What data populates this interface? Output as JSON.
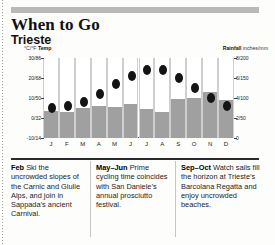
{
  "page": {
    "title": "When to Go",
    "subtitle": "Trieste"
  },
  "chart_labels": {
    "left_axis_strong": "Temp",
    "left_axis_unit": "°C/°F ",
    "right_axis_strong": "Rainfall",
    "right_axis_unit": " inches/mm"
  },
  "tips": [
    {
      "period": "Feb",
      "text": " Ski the uncrowded slopes of the Carnic and Giulie Alps, and join in Sappada’s ancient Carnival."
    },
    {
      "period": "May–Jun",
      "text": " Prime cycling time coincides with San Daniele’s annual prosciutto festival."
    },
    {
      "period": "Sep–Oct",
      "text": " Watch sails fill the horizon at Trieste’s Barcolana Regatta and enjoy uncrowded beaches."
    }
  ],
  "chart_data": {
    "type": "bar",
    "categories": [
      "J",
      "F",
      "M",
      "A",
      "M",
      "J",
      "J",
      "A",
      "S",
      "O",
      "N",
      "D"
    ],
    "series": [
      {
        "name": "Rainfall",
        "type": "bar",
        "unit": "inches",
        "axis": "right",
        "values": [
          2.7,
          2.6,
          3.0,
          3.2,
          3.1,
          3.4,
          2.9,
          2.6,
          3.9,
          4.0,
          4.6,
          3.8
        ]
      },
      {
        "name": "Temp",
        "type": "scatter",
        "unit": "°C",
        "axis": "left",
        "values": [
          5,
          6,
          8,
          12,
          17,
          21,
          24,
          24,
          20,
          15,
          10,
          6
        ]
      }
    ],
    "left_axis": {
      "label": "°C/°F Temp",
      "ticks": [
        "30/86",
        "20/68",
        "10/50",
        "0/32",
        "-10/14"
      ],
      "tick_values": [
        30,
        20,
        10,
        0,
        -10
      ],
      "range": [
        -10,
        30
      ]
    },
    "right_axis": {
      "label": "Rainfall inches/mm",
      "ticks": [
        "8/200",
        "6/150",
        "4/100",
        "2/50",
        "0"
      ],
      "tick_values": [
        8,
        6,
        4,
        2,
        0
      ],
      "range": [
        0,
        8
      ]
    },
    "xlabel": "",
    "grid": "vertical-column-separators",
    "legend": "none",
    "colors": {
      "bar": "#a0a0a0",
      "dot": "#141414",
      "gridline": "#cfcfcf",
      "header_band": "#b9b9b9"
    }
  }
}
